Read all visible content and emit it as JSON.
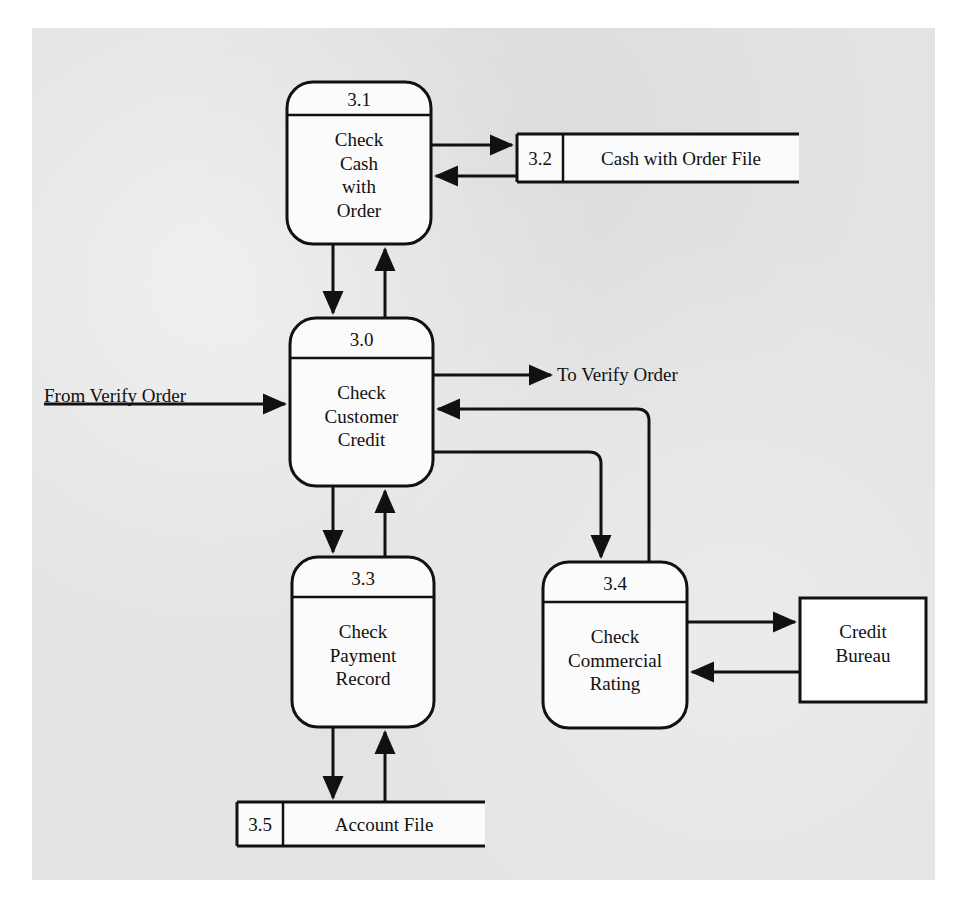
{
  "diagram": {
    "type": "data-flow-diagram",
    "background_color": "#e3e3e3",
    "line_color": "#111111",
    "shape_fill": "#fbfbfb",
    "processes": [
      {
        "id": "3.1",
        "number": "3.1",
        "name": "Check\nCash\nwith\nOrder",
        "name_lines": [
          "Check",
          "Cash",
          "with",
          "Order"
        ],
        "x": 287,
        "y": 82,
        "w": 144,
        "h": 162,
        "header_h": 33
      },
      {
        "id": "3.0",
        "number": "3.0",
        "name": "Check\nCustomer\nCredit",
        "name_lines": [
          "Check",
          "Customer",
          "Credit"
        ],
        "x": 290,
        "y": 318,
        "w": 143,
        "h": 168,
        "header_h": 40
      },
      {
        "id": "3.3",
        "number": "3.3",
        "name": "Check\nPayment\nRecord",
        "name_lines": [
          "Check",
          "Payment",
          "Record"
        ],
        "x": 292,
        "y": 557,
        "w": 142,
        "h": 170,
        "header_h": 40
      },
      {
        "id": "3.4",
        "number": "3.4",
        "name": "Check\nCommercial\nRating",
        "name_lines": [
          "Check",
          "Commercial",
          "Rating"
        ],
        "x": 543,
        "y": 562,
        "w": 144,
        "h": 166,
        "header_h": 40
      }
    ],
    "data_stores": [
      {
        "id": "3.2",
        "number": "3.2",
        "name": "Cash with Order File",
        "x": 517,
        "y": 134,
        "w": 282,
        "h": 48,
        "num_w": 46
      },
      {
        "id": "3.5",
        "number": "3.5",
        "name": "Account File",
        "x": 237,
        "y": 802,
        "w": 248,
        "h": 44,
        "num_w": 46
      }
    ],
    "external_entities": [
      {
        "id": "credit-bureau",
        "name": "Credit\nBureau",
        "name_lines": [
          "Credit",
          "Bureau"
        ],
        "x": 800,
        "y": 598,
        "w": 126,
        "h": 104
      }
    ],
    "flow_labels": [
      {
        "id": "from-verify-order",
        "text": "From Verify Order",
        "x": 44,
        "y": 385
      },
      {
        "id": "to-verify-order",
        "text": "To Verify Order",
        "x": 557,
        "y": 357
      }
    ],
    "flows": [
      {
        "from": "3.1",
        "to": "3.2",
        "direction": "right"
      },
      {
        "from": "3.2",
        "to": "3.1",
        "direction": "left"
      },
      {
        "from": "3.1",
        "to": "3.0",
        "direction": "down"
      },
      {
        "from": "3.0",
        "to": "3.1",
        "direction": "up"
      },
      {
        "from": "external",
        "to": "3.0",
        "direction": "right",
        "label": "From Verify Order"
      },
      {
        "from": "3.0",
        "to": "external",
        "direction": "right",
        "label": "To Verify Order"
      },
      {
        "from": "3.0",
        "to": "3.3",
        "direction": "down"
      },
      {
        "from": "3.3",
        "to": "3.0",
        "direction": "up"
      },
      {
        "from": "3.0",
        "to": "3.4",
        "direction": "down-right"
      },
      {
        "from": "3.4",
        "to": "3.0",
        "direction": "up-left"
      },
      {
        "from": "3.3",
        "to": "3.5",
        "direction": "down"
      },
      {
        "from": "3.5",
        "to": "3.3",
        "direction": "up"
      },
      {
        "from": "3.4",
        "to": "credit-bureau",
        "direction": "right"
      },
      {
        "from": "credit-bureau",
        "to": "3.4",
        "direction": "left"
      }
    ]
  }
}
